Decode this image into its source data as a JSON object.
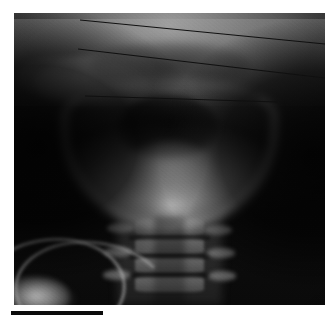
{
  "figure": {
    "kind": "radiograph",
    "modality": "X-ray",
    "view": "anteroposterior",
    "region": "skull-base-and-cervical-spine",
    "caption": "",
    "background_color": "#ffffff"
  },
  "radiograph": {
    "label": "ap-radiograph-head-neck",
    "frame": {
      "x": 14,
      "y": 13,
      "width": 311,
      "height": 292
    },
    "film_color_dark": "#080808",
    "film_color_light": "#e8e8e8",
    "anatomy": [
      {
        "name": "cranial-vault",
        "label": "cranial vault"
      },
      {
        "name": "skull-base",
        "label": "skull base"
      },
      {
        "name": "petrous-ridge-left",
        "label": "left petrous ridge"
      },
      {
        "name": "petrous-ridge-right",
        "label": "right petrous ridge"
      },
      {
        "name": "nasopharyngeal-air",
        "label": "nasopharyngeal air shadow"
      },
      {
        "name": "mandible",
        "label": "mandible"
      },
      {
        "name": "oropharyngeal-air",
        "label": "oropharyngeal air"
      },
      {
        "name": "tongue-soft-tissue",
        "label": "tongue soft tissue"
      },
      {
        "name": "mandibular-symphysis",
        "label": "mandibular symphysis"
      },
      {
        "name": "cervical-spine",
        "label": "cervical spine"
      },
      {
        "name": "tracheal-air-column",
        "label": "tracheal air column"
      },
      {
        "name": "clavicle-left",
        "label": "left clavicle"
      },
      {
        "name": "clavicle-right",
        "label": "right clavicle"
      }
    ],
    "vertebrae": [
      {
        "name": "vertebra-c3",
        "top_pct": 70.5
      },
      {
        "name": "vertebra-c4",
        "top_pct": 77.0
      },
      {
        "name": "vertebra-c5",
        "top_pct": 83.5
      },
      {
        "name": "vertebra-c6",
        "top_pct": 90.0
      }
    ],
    "discs": [
      {
        "name": "disc-c3-c4",
        "top_pct": 76.2
      },
      {
        "name": "disc-c4-c5",
        "top_pct": 82.7
      },
      {
        "name": "disc-c5-c6",
        "top_pct": 89.2
      }
    ],
    "processes": [
      {
        "name": "process-left-upper",
        "left_pct": 30.0,
        "top_pct": 72.0
      },
      {
        "name": "process-right-upper",
        "left_pct": 61.0,
        "top_pct": 72.5
      },
      {
        "name": "process-left-mid",
        "left_pct": 29.0,
        "top_pct": 80.0
      },
      {
        "name": "process-right-mid",
        "left_pct": 62.0,
        "top_pct": 80.5
      },
      {
        "name": "process-left-lower",
        "left_pct": 28.5,
        "top_pct": 88.0
      },
      {
        "name": "process-right-lower",
        "left_pct": 62.5,
        "top_pct": 88.5
      }
    ]
  },
  "reference_lines": {
    "color": "#101010",
    "stroke_width": 1.1,
    "count": 3,
    "lines": [
      {
        "name": "reference-line-1",
        "label": "line 1",
        "x1": 80,
        "y1": 20,
        "x2": 325,
        "y2": 44
      },
      {
        "name": "reference-line-2",
        "label": "line 2",
        "x1": 78,
        "y1": 49,
        "x2": 325,
        "y2": 78
      },
      {
        "name": "reference-line-3",
        "label": "line 3",
        "x1": 85,
        "y1": 96,
        "x2": 278,
        "y2": 102
      }
    ]
  },
  "scale_bar": {
    "name": "scale-bar",
    "label": "",
    "color": "#0b0b0b",
    "x": 11,
    "y": 311,
    "width": 92,
    "height": 4
  }
}
